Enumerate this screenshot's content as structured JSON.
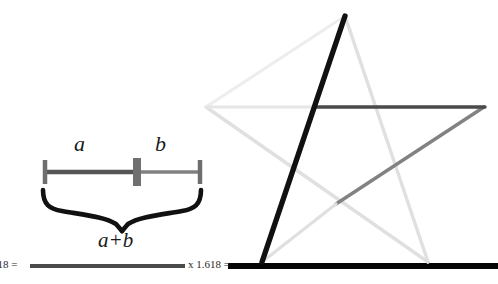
{
  "figure": {
    "background_color": "#ffffff"
  },
  "segment_diagram": {
    "label_a": "a",
    "label_b": "b",
    "label_sum": "a+b",
    "bar": {
      "left_tick_x": 44,
      "mid_tick_x": 137,
      "right_tick_x": 200,
      "baseline_y": 172,
      "color_a": "#555555",
      "color_b": "#808080",
      "tick_color": "#6e6e6e"
    },
    "brace": {
      "left_x": 42,
      "right_x": 202,
      "top_y": 188,
      "point_x": 122,
      "point_y": 226,
      "color": "#111111"
    }
  },
  "multiplier_row": {
    "left_text": "618 =",
    "right_text": "x 1.618 =",
    "left_line": {
      "x1": 30,
      "x2": 185,
      "y": 266,
      "color": "#4a4a4a",
      "width": 4
    },
    "right_line": {
      "x1": 228,
      "x2": 498,
      "y": 266,
      "color": "#050505",
      "width": 6
    }
  },
  "pentagram": {
    "vertices": {
      "top": [
        345,
        16
      ],
      "right": [
        484,
        107
      ],
      "bottom_right": [
        428,
        262
      ],
      "bottom_left": [
        262,
        262
      ],
      "left": [
        206,
        107
      ]
    },
    "edges": [
      {
        "name": "top-to-bottom-left",
        "from": "top",
        "to": "bottom_left",
        "color": "#111111",
        "width": 5.5
      },
      {
        "name": "left-to-right-horizontal",
        "from": "left",
        "to": "right",
        "color": "#4a4a4a",
        "width": 3.2
      },
      {
        "name": "right-to-bottom-left-diagonal",
        "from": "right",
        "to": "bottom_left",
        "color": "#777777",
        "width": 3.2
      },
      {
        "name": "top-to-bottom-right",
        "from": "top",
        "to": "bottom_right",
        "color": "#e0e0e0",
        "width": 3.2
      },
      {
        "name": "left-to-bottom-right",
        "from": "left",
        "to": "bottom_right",
        "color": "#e0e0e0",
        "width": 3.2
      }
    ],
    "colors": {
      "black": "#111111",
      "dark_gray": "#4a4a4a",
      "mid_gray": "#777777",
      "light_gray": "#e0e0e0"
    }
  }
}
